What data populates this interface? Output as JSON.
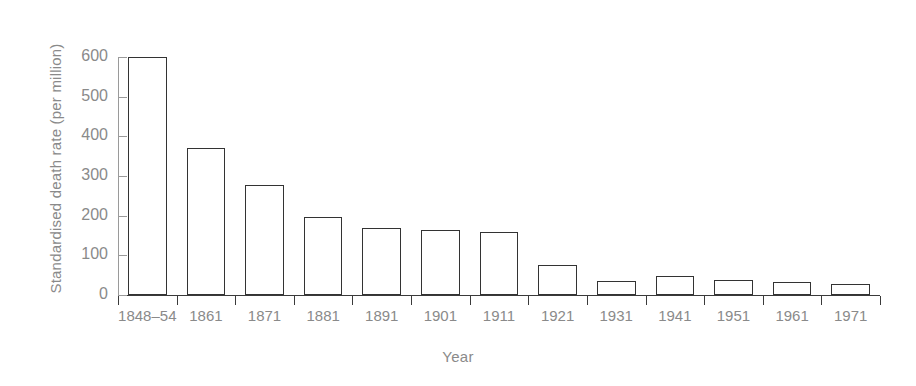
{
  "chart_data": {
    "type": "bar",
    "title": "",
    "xlabel": "Year",
    "ylabel": "Standardised death rate (per million)",
    "categories": [
      "1848–54",
      "1861",
      "1871",
      "1881",
      "1891",
      "1901",
      "1911",
      "1921",
      "1931",
      "1941",
      "1951",
      "1961",
      "1971"
    ],
    "values": [
      600,
      370,
      278,
      197,
      168,
      165,
      160,
      76,
      35,
      48,
      37,
      32,
      28
    ],
    "ylim": [
      0,
      600
    ],
    "yticks": [
      0,
      100,
      200,
      300,
      400,
      500,
      600
    ],
    "ytick_labels": [
      "0",
      "100",
      "200",
      "300",
      "400",
      "500",
      "600"
    ],
    "grid": false,
    "legend": null,
    "series": [
      {
        "name": "Standardised death rate",
        "values": [
          600,
          370,
          278,
          197,
          168,
          165,
          160,
          76,
          35,
          48,
          37,
          32,
          28
        ]
      }
    ]
  },
  "style": {
    "bar_fill": "#ffffff",
    "bar_stroke": "#333333",
    "axis_color": "#3a3a3a",
    "tick_color": "#9a9a9a",
    "label_color": "#8a8a8a",
    "background": "#ffffff"
  }
}
